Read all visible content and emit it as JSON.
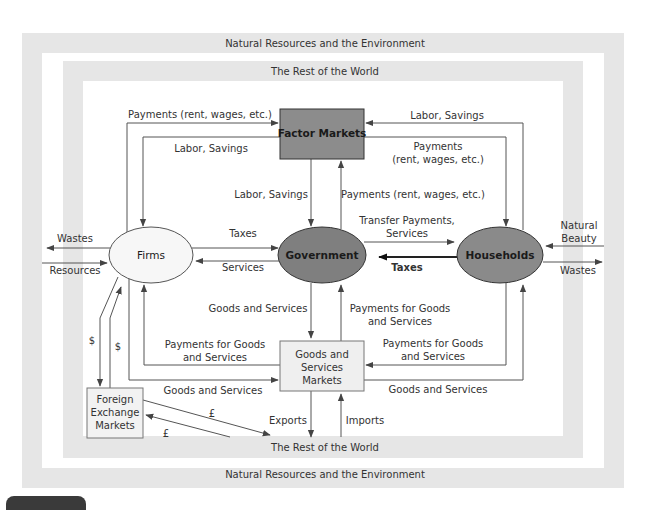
{
  "figure": {
    "outer_band": {
      "top_label": "Natural Resources and the Environment",
      "bottom_label": "Natural Resources and the Environment"
    },
    "inner_band": {
      "top_label": "The Rest of the World",
      "bottom_label": "The Rest of the World"
    },
    "colors": {
      "band": "#e6e6e6",
      "factor_markets_fill": "#8c8c8c",
      "government_fill": "#7f7f7f",
      "households_fill": "#8a8a8a",
      "firms_fill": "#f7f7f7",
      "goods_markets_fill": "#efefef",
      "forex_fill": "#f2f2f2",
      "line": "#555555",
      "text": "#333333"
    },
    "nodes": {
      "factor_markets": "Factor Markets",
      "firms": "Firms",
      "government": "Government",
      "households": "Households",
      "goods_markets": [
        "Goods and",
        "Services",
        "Markets"
      ],
      "forex": [
        "Foreign",
        "Exchange",
        "Markets"
      ]
    },
    "flows": {
      "firms_to_factor_payments": "Payments (rent, wages, etc.)",
      "factor_to_firms_labor": "Labor, Savings",
      "households_to_factor_labor": "Labor, Savings",
      "factor_to_households_payments": [
        "Payments",
        "(rent, wages, etc.)"
      ],
      "factor_to_government_labor": "Labor, Savings",
      "government_to_factor_payments": "Payments (rent, wages, etc.)",
      "firms_to_government_taxes": "Taxes",
      "government_to_firms_services": "Services",
      "government_to_households_transfers": [
        "Transfer Payments,",
        "Services"
      ],
      "households_to_government_taxes": "Taxes",
      "goods_to_government": "Goods and Services",
      "government_to_goods_payments": [
        "Payments for Goods",
        "and Services"
      ],
      "firms_from_goods_payments": [
        "Payments for Goods",
        "and Services"
      ],
      "households_to_goods_payments": [
        "Payments for Goods",
        "and Services"
      ],
      "firms_to_goods": "Goods and Services",
      "goods_to_households": "Goods and Services",
      "firms_wastes": "Wastes",
      "firms_resources": "Resources",
      "households_natural_beauty": [
        "Natural",
        "Beauty"
      ],
      "households_wastes": "Wastes",
      "dollar_1": "$",
      "dollar_2": "$",
      "pound_1": "£",
      "pound_2": "£",
      "exports": "Exports",
      "imports": "Imports"
    }
  }
}
